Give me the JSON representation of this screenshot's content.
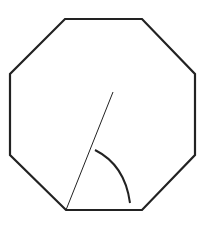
{
  "diagram": {
    "type": "geometry",
    "shape": "regular-octagon",
    "stroke_color": "#222222",
    "background": "#ffffff",
    "octagon_points": "65,19 142,19 195,74 195,155 142,210 66,210 10,155 10,74",
    "radius_line": {
      "x1": 66,
      "y1": 210,
      "x2": 113,
      "y2": 92
    },
    "angle_arc": {
      "path": "M 95 150 Q 125 165 130 203"
    },
    "labels": []
  }
}
